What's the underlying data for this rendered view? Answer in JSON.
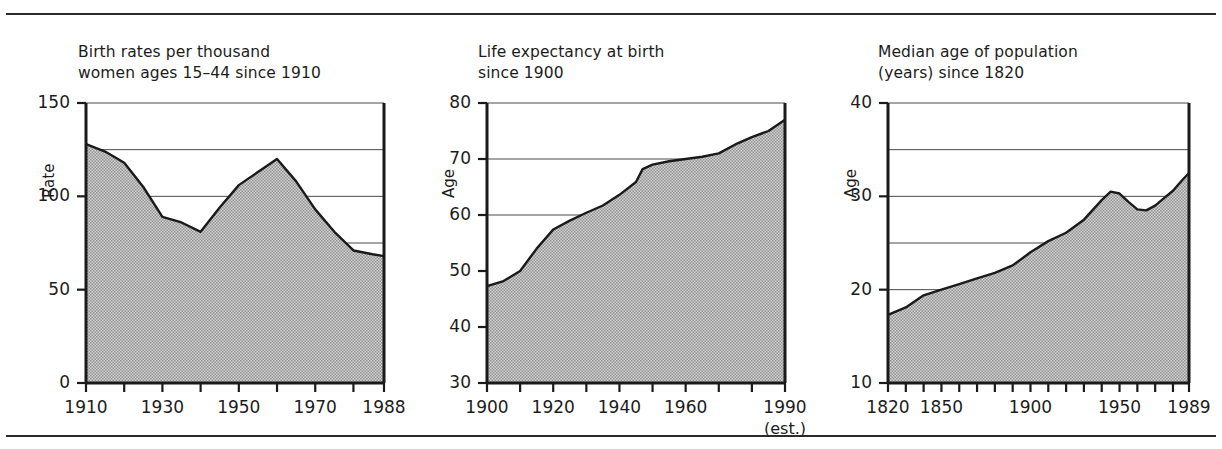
{
  "figure": {
    "has_top_rule": true,
    "has_bottom_rule": true,
    "fill_color": "#b9b9b9",
    "line_color": "#1a1a1a",
    "grid_color": "#4a4a4a"
  },
  "chart_data": [
    {
      "type": "area",
      "panel_index": 1,
      "title": "Birth rates per thousand\nwomen ages 15–44 since 1910",
      "xlabel": "",
      "ylabel": "Rate",
      "xlim": [
        1910,
        1988
      ],
      "ylim": [
        0,
        150
      ],
      "ytick_labels": [
        "0",
        "50",
        "100",
        "150"
      ],
      "yticks": [
        0,
        50,
        100,
        150
      ],
      "gridlines": [
        75,
        100,
        125,
        150
      ],
      "grid": true,
      "xtick_labels": [
        "1910",
        "1930",
        "1950",
        "1970",
        "1988"
      ],
      "xticks_labeled": [
        1910,
        1930,
        1950,
        1970,
        1988
      ],
      "xticks_all": [
        1910,
        1920,
        1930,
        1940,
        1950,
        1960,
        1970,
        1980,
        1988
      ],
      "x": [
        1910,
        1915,
        1920,
        1925,
        1930,
        1935,
        1940,
        1945,
        1950,
        1955,
        1960,
        1965,
        1970,
        1975,
        1980,
        1985,
        1988
      ],
      "values": [
        128,
        124,
        118,
        105,
        89,
        86,
        81,
        94,
        106,
        113,
        120,
        108,
        93,
        81,
        71,
        69,
        68
      ],
      "legend": []
    },
    {
      "type": "area",
      "panel_index": 2,
      "title": "Life expectancy at birth\nsince 1900",
      "xlabel": "",
      "ylabel": "Age",
      "xlim": [
        1900,
        1990
      ],
      "ylim": [
        30,
        80
      ],
      "ytick_labels": [
        "30",
        "40",
        "50",
        "60",
        "70",
        "80"
      ],
      "yticks": [
        30,
        40,
        50,
        60,
        70,
        80
      ],
      "gridlines": [
        60,
        70,
        80
      ],
      "grid": true,
      "xtick_labels": [
        "1900",
        "1920",
        "1940",
        "1960",
        "1990"
      ],
      "xticks_labeled": [
        1900,
        1920,
        1940,
        1960,
        1990
      ],
      "xticks_all": [
        1900,
        1910,
        1920,
        1930,
        1940,
        1950,
        1960,
        1970,
        1980,
        1990
      ],
      "xtick_sublabel": "(est.)",
      "xtick_sublabel_at": 1990,
      "x": [
        1900,
        1905,
        1910,
        1915,
        1920,
        1925,
        1930,
        1935,
        1940,
        1945,
        1947,
        1950,
        1955,
        1960,
        1965,
        1970,
        1975,
        1980,
        1985,
        1990
      ],
      "values": [
        47.3,
        48.2,
        50.0,
        54.0,
        57.4,
        59.0,
        60.4,
        61.7,
        63.6,
        65.9,
        68.2,
        69.0,
        69.6,
        70.0,
        70.4,
        71.0,
        72.6,
        73.9,
        75.0,
        77.0
      ],
      "legend": []
    },
    {
      "type": "area",
      "panel_index": 3,
      "title": "Median age of population\n(years) since 1820",
      "xlabel": "",
      "ylabel": "Age",
      "xlim": [
        1820,
        1989
      ],
      "ylim": [
        10,
        40
      ],
      "ytick_labels": [
        "10",
        "20",
        "30",
        "40"
      ],
      "yticks": [
        10,
        20,
        30,
        40
      ],
      "gridlines": [
        20,
        25,
        30,
        35,
        40
      ],
      "grid": true,
      "xtick_labels": [
        "1820",
        "1850",
        "1900",
        "1950",
        "1989"
      ],
      "xticks_labeled": [
        1820,
        1850,
        1900,
        1950,
        1989
      ],
      "xticks_all": [
        1820,
        1830,
        1840,
        1850,
        1860,
        1870,
        1880,
        1890,
        1900,
        1910,
        1920,
        1930,
        1940,
        1950,
        1960,
        1970,
        1980,
        1989
      ],
      "x": [
        1820,
        1830,
        1840,
        1850,
        1860,
        1870,
        1880,
        1890,
        1900,
        1910,
        1920,
        1930,
        1940,
        1945,
        1950,
        1955,
        1960,
        1965,
        1970,
        1975,
        1980,
        1985,
        1989
      ],
      "values": [
        17.3,
        18.1,
        19.4,
        20.0,
        20.6,
        21.2,
        21.8,
        22.6,
        24.0,
        25.2,
        26.1,
        27.5,
        29.6,
        30.5,
        30.3,
        29.4,
        28.6,
        28.5,
        29.0,
        29.8,
        30.6,
        31.7,
        32.5
      ],
      "legend": []
    }
  ]
}
